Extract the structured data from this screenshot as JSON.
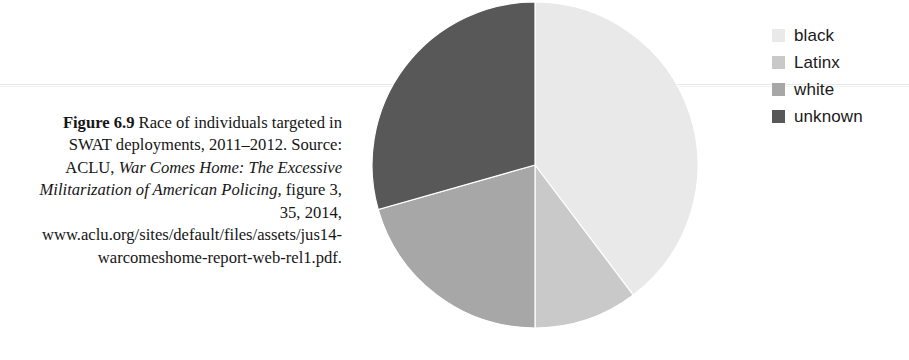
{
  "caption": {
    "figure_number": "Figure 6.9",
    "text_part_1": " Race of individuals targeted in SWAT deployments, 2011–2012. Source: ACLU, ",
    "title_italic": "War Comes Home: The Excessive Militarization of American Policing,",
    "text_part_2": " figure 3, 35, 2014, www.aclu.org/sites/default/files/assets/jus14-warcomeshome-report-web-rel1.pdf."
  },
  "legend": {
    "items": [
      {
        "label": "black",
        "color": "#e9e9e9"
      },
      {
        "label": "Latinx",
        "color": "#c9c9c9"
      },
      {
        "label": "white",
        "color": "#a7a7a7"
      },
      {
        "label": "unknown",
        "color": "#585858"
      }
    ]
  },
  "chart_data": {
    "type": "pie",
    "categories": [
      "black",
      "Latinx",
      "white",
      "unknown"
    ],
    "values": [
      39.7,
      10.3,
      20.6,
      29.4
    ],
    "value_unit": "percent",
    "colors": [
      "#e9e9e9",
      "#c9c9c9",
      "#a7a7a7",
      "#585858"
    ],
    "start_angle_deg": 0,
    "direction": "clockwise",
    "boundary_angles_deg": [
      0,
      143,
      180,
      254,
      360
    ],
    "legend_position": "right",
    "grid": false,
    "xlabel": "",
    "ylabel": "",
    "labels_shown": false
  }
}
